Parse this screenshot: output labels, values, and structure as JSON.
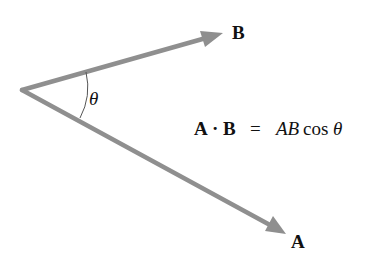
{
  "diagram": {
    "colors": {
      "vector": "#8f8f8f",
      "arc": "#555555",
      "text": "#111111",
      "background": "#ffffff"
    },
    "vertex": {
      "x": 22,
      "y": 90
    },
    "vectors": [
      {
        "name": "B",
        "label": "B",
        "tip": {
          "x": 222,
          "y": 33
        }
      },
      {
        "name": "A",
        "label": "A",
        "tip": {
          "x": 285,
          "y": 233
        }
      }
    ],
    "angle": {
      "symbol": "θ"
    },
    "equation": {
      "lhs_a": "A",
      "dot": "·",
      "lhs_b": "B",
      "equals": "=",
      "rhs_ab": "AB",
      "rhs_cos": "cos",
      "rhs_theta": "θ"
    }
  }
}
